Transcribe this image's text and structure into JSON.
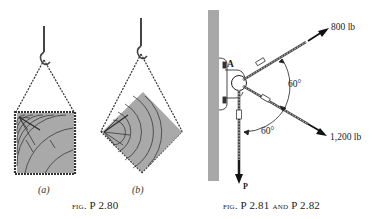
{
  "figure_left": {
    "caption_prefix": "fig.",
    "caption_number": "P 2.80",
    "subfigures": [
      {
        "label": "(a)",
        "description": "square crate hung by chain from hook, sides horizontal/vertical"
      },
      {
        "label": "(b)",
        "description": "square crate hung by chain from hook, rotated 45 degrees as a diamond"
      }
    ]
  },
  "figure_right": {
    "caption_prefix": "fig.",
    "caption_number_1": "P 2.81",
    "caption_conjunction": "and",
    "caption_number_2": "P 2.82",
    "point_label": "A",
    "forces": [
      {
        "label": "800 lb",
        "direction": "up-right"
      },
      {
        "label": "1,200 lb",
        "direction": "down-right"
      },
      {
        "label": "P",
        "direction": "down"
      }
    ],
    "angles": [
      {
        "label": "60°",
        "between": "800 lb and 1,200 lb"
      },
      {
        "label": "60°",
        "between": "1,200 lb and P"
      }
    ]
  },
  "colors": {
    "crate_fill": "#a9a9a9",
    "wall_fill": "#a8a8a8",
    "ink": "#1a1a1a"
  }
}
